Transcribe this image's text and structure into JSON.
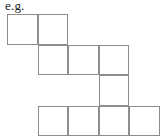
{
  "figure": {
    "caption": "e.g.",
    "type": "polyomino-grid",
    "cell_count": 10,
    "cell_size_px": 30.5,
    "origin_px": {
      "x": 7,
      "y": 14
    },
    "grid_columns": 5,
    "grid_rows": 4,
    "colors": {
      "line": "#8d8d8d",
      "fill": "#ffffff",
      "caption_text": "#1a1a1a",
      "background": "#ffffff"
    },
    "rows": [
      {
        "row": 1,
        "columns": [
          1,
          2
        ],
        "cell_count": 2
      },
      {
        "row": 2,
        "columns": [
          2,
          3,
          4
        ],
        "cell_count": 3
      },
      {
        "row": 3,
        "columns": [
          4
        ],
        "cell_count": 1
      },
      {
        "row": 4,
        "columns": [
          2,
          3,
          4,
          5
        ],
        "cell_count": 4
      }
    ],
    "cells": [
      {
        "name": "cell-r1c1",
        "row": 1,
        "col": 1,
        "x": 7,
        "y": 14,
        "w": 30.5,
        "h": 30.5
      },
      {
        "name": "cell-r1c2",
        "row": 1,
        "col": 2,
        "x": 37.5,
        "y": 14,
        "w": 30.5,
        "h": 30.5
      },
      {
        "name": "cell-r2c2",
        "row": 2,
        "col": 2,
        "x": 37.5,
        "y": 44.5,
        "w": 30.5,
        "h": 30.5
      },
      {
        "name": "cell-r2c3",
        "row": 2,
        "col": 3,
        "x": 68,
        "y": 44.5,
        "w": 30.5,
        "h": 30.5
      },
      {
        "name": "cell-r2c4",
        "row": 2,
        "col": 4,
        "x": 98.5,
        "y": 44.5,
        "w": 30.5,
        "h": 30.5
      },
      {
        "name": "cell-r3c4",
        "row": 3,
        "col": 4,
        "x": 98.5,
        "y": 75,
        "w": 30.5,
        "h": 30.5
      },
      {
        "name": "cell-r4c2",
        "row": 4,
        "col": 2,
        "x": 37.5,
        "y": 105.5,
        "w": 30.5,
        "h": 30.5
      },
      {
        "name": "cell-r4c3",
        "row": 4,
        "col": 3,
        "x": 68,
        "y": 105.5,
        "w": 30.5,
        "h": 30.5
      },
      {
        "name": "cell-r4c4",
        "row": 4,
        "col": 4,
        "x": 98.5,
        "y": 105.5,
        "w": 30.5,
        "h": 30.5
      },
      {
        "name": "cell-r4c5",
        "row": 4,
        "col": 5,
        "x": 129,
        "y": 105.5,
        "w": 30.5,
        "h": 30.5
      }
    ]
  }
}
